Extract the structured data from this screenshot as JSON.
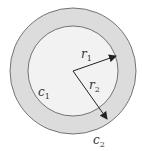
{
  "diagram": {
    "type": "concentric-circles",
    "colors": {
      "background": "#ffffff",
      "ring_fill": "#dcdcdc",
      "inner_fill": "#f2f2f2",
      "stroke": "#555555",
      "arrow": "#222222"
    },
    "labels": {
      "r1": {
        "base": "r",
        "sub": "1"
      },
      "r2": {
        "base": "r",
        "sub": "2"
      },
      "c1": {
        "base": "c",
        "sub": "1"
      },
      "c2": {
        "base": "c",
        "sub": "2"
      }
    }
  }
}
